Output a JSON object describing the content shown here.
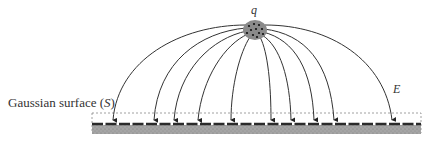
{
  "diagram": {
    "charge_label": "q",
    "field_label": "E",
    "surface_label": "Gaussian surface (",
    "surface_symbol": "S",
    "surface_label_close": ")",
    "colors": {
      "line": "#333333",
      "charge_fill": "#8a8a8a",
      "charge_dots": "#111111",
      "plate_dark": "#2a2a2a",
      "plate_gray": "#9a9a9a",
      "gaussian_dash": "#888888"
    },
    "field_line_endpoints_x": [
      113,
      154,
      174,
      198,
      231,
      271,
      291,
      314,
      334,
      392
    ]
  }
}
